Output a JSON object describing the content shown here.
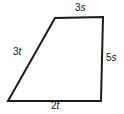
{
  "figure": {
    "shape_name": "quadrilateral",
    "stroke_color": "#1a1a1a",
    "background_color": "#ffffff",
    "stroke_width": 2,
    "vertices": {
      "bottom_left": {
        "x": 8,
        "y": 101
      },
      "top_left": {
        "x": 55,
        "y": 18
      },
      "top_right": {
        "x": 103,
        "y": 17
      },
      "bottom_right": {
        "x": 101,
        "y": 101
      }
    },
    "labels": {
      "top": {
        "coefficient": "3",
        "variable": "s",
        "full": "3s"
      },
      "left": {
        "coefficient": "3",
        "variable": "t",
        "full": "3t"
      },
      "right": {
        "coefficient": "5",
        "variable": "s",
        "full": "5s"
      },
      "bottom": {
        "coefficient": "2",
        "variable": "t",
        "full": "2t"
      }
    }
  }
}
